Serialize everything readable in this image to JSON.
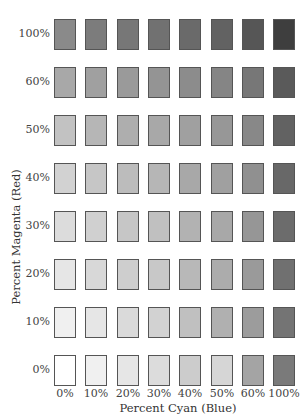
{
  "chart_data": {
    "type": "heatmap",
    "title": "",
    "xlabel": "Percent Cyan (Blue)",
    "ylabel": "Percent Magenta (Red)",
    "x_categories": [
      "0%",
      "10%",
      "20%",
      "30%",
      "40%",
      "50%",
      "60%",
      "100%"
    ],
    "y_categories": [
      "100%",
      "60%",
      "50%",
      "40%",
      "30%",
      "20%",
      "10%",
      "0%"
    ],
    "grid": false,
    "legend": "none",
    "cells_gray": [
      [
        "#8a8a8a",
        "#7c7c7c",
        "#777777",
        "#717171",
        "#6a6a6a",
        "#626262",
        "#565656",
        "#3e3e3e"
      ],
      [
        "#a8a8a8",
        "#a0a0a0",
        "#9a9a9a",
        "#949494",
        "#8c8c8c",
        "#858585",
        "#777777",
        "#5a5a5a"
      ],
      [
        "#c2c2c2",
        "#b6b6b6",
        "#aeaeae",
        "#a8a8a8",
        "#a0a0a0",
        "#979797",
        "#888888",
        "#626262"
      ],
      [
        "#d2d2d2",
        "#c6c6c6",
        "#bcbcbc",
        "#b6b6b6",
        "#a8a8a8",
        "#a0a0a0",
        "#909090",
        "#686868"
      ],
      [
        "#dcdcdc",
        "#d0d0d0",
        "#c6c6c6",
        "#c0c0c0",
        "#b2b2b2",
        "#a8a8a8",
        "#969696",
        "#6c6c6c"
      ],
      [
        "#e6e6e6",
        "#d8d8d8",
        "#cecece",
        "#c8c8c8",
        "#b8b8b8",
        "#acacac",
        "#9a9a9a",
        "#707070"
      ],
      [
        "#f0f0f0",
        "#e6e6e6",
        "#dadada",
        "#d2d2d2",
        "#c0c0c0",
        "#b0b0b0",
        "#9c9c9c",
        "#747474"
      ],
      [
        "#ffffff",
        "#f0f0f0",
        "#e6e6e6",
        "#dcdcdc",
        "#cccccc",
        "#d6d6d6",
        "#a4a4a4",
        "#7a7a7a"
      ]
    ]
  },
  "axes": {
    "x_title": "Percent Cyan (Blue)",
    "y_title": "Percent Magenta (Red)",
    "x_ticks": [
      "0%",
      "10%",
      "20%",
      "30%",
      "40%",
      "50%",
      "60%",
      "100%"
    ],
    "y_ticks": [
      "100%",
      "60%",
      "50%",
      "40%",
      "30%",
      "20%",
      "10%",
      "0%"
    ]
  }
}
